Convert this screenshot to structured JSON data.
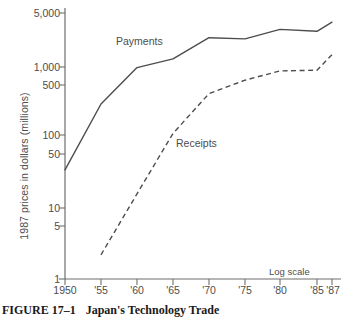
{
  "figure": {
    "caption_number": "FIGURE 17–1",
    "caption_title": "Japan's Technology Trade"
  },
  "annotations": {
    "payments_label": "Payments",
    "receipts_label": "Receipts",
    "log_scale_note": "Log scale"
  },
  "chart_data": {
    "type": "line",
    "title": "Japan's Technology Trade",
    "xlabel": "",
    "ylabel": "1987 prices in dollars (millions)",
    "yscale": "log",
    "ylim": [
      1,
      6000
    ],
    "xlim": [
      1950,
      1987
    ],
    "grid": false,
    "legend_position": "inline-annotation",
    "ytick_labels": [
      "5,000",
      "1,000",
      "500",
      "100",
      "50",
      "10",
      "5",
      "1"
    ],
    "ytick_values": [
      5000,
      1000,
      500,
      100,
      50,
      10,
      5,
      1
    ],
    "xtick_labels": [
      "1950",
      "'55",
      "'60",
      "'65",
      "'70",
      "'75",
      "'80",
      "'85",
      "'87"
    ],
    "xtick_values": [
      1950,
      1955,
      1960,
      1965,
      1970,
      1975,
      1980,
      1985,
      1987
    ],
    "x": [
      1950,
      1955,
      1960,
      1965,
      1970,
      1975,
      1980,
      1985,
      1987
    ],
    "series": [
      {
        "name": "Payments",
        "style": "solid",
        "color": "#4d4d4d",
        "values": [
          35,
          300,
          980,
          1300,
          2600,
          2500,
          3400,
          3200,
          4300
        ]
      },
      {
        "name": "Receipts",
        "style": "dashed",
        "color": "#4d4d4d",
        "values": [
          null,
          2.2,
          16,
          115,
          420,
          650,
          880,
          900,
          1500
        ]
      }
    ]
  },
  "colors": {
    "axis": "#6e6e6e",
    "line": "#4d4d4d",
    "text": "#4d4d4d",
    "caption": "#1a1a1a",
    "background": "#ffffff"
  }
}
